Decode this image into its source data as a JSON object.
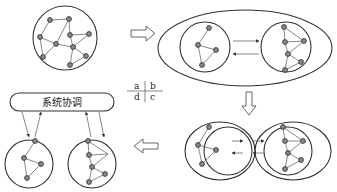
{
  "diagram": {
    "type": "process-flow",
    "quadrant_legend": {
      "a": "a",
      "b": "b",
      "c": "c",
      "d": "d"
    },
    "coordinator": {
      "label": "系统协调"
    },
    "stages": [
      {
        "id": "a",
        "name": "original-network",
        "nodes": 11
      },
      {
        "id": "b",
        "name": "partitioned-subnetworks",
        "nodes": [
          4,
          6
        ]
      },
      {
        "id": "c",
        "name": "bounded-subnetworks",
        "nodes": [
          4,
          6
        ]
      },
      {
        "id": "d",
        "name": "coordinated-subsystems",
        "nodes": [
          4,
          6
        ]
      }
    ],
    "flow_arrows": [
      {
        "from": "a",
        "to": "b",
        "direction": "right"
      },
      {
        "from": "b",
        "to": "c",
        "direction": "down"
      },
      {
        "from": "c",
        "to": "d",
        "direction": "left"
      }
    ],
    "colors": {
      "line": "#333333",
      "node_fill": "#8a8a8a",
      "background": "#ffffff"
    }
  }
}
